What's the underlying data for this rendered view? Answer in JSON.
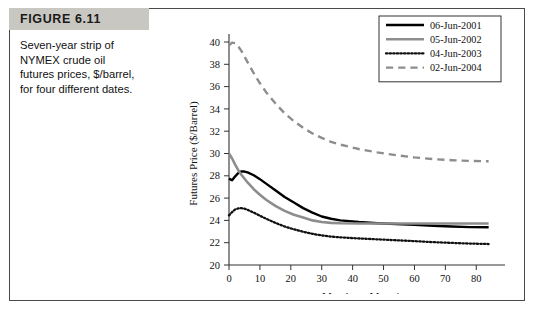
{
  "figure": {
    "number_label": "FIGURE 6.11",
    "caption_lines": [
      "Seven-year strip of",
      "NYMEX crude oil",
      "futures prices, $/barrel,",
      "for four different dates."
    ]
  },
  "chart_data": {
    "type": "line",
    "title": "",
    "xlabel": "Months to Maturity",
    "ylabel": "Futures Price ($/Barrel)",
    "xlim": [
      0,
      88
    ],
    "ylim": [
      20,
      40
    ],
    "xticks": [
      0,
      10,
      20,
      30,
      40,
      50,
      60,
      70,
      80
    ],
    "yticks": [
      20,
      22,
      24,
      26,
      28,
      30,
      32,
      34,
      36,
      38,
      40
    ],
    "grid": false,
    "legend_position": "top-right",
    "series": [
      {
        "name": "06-Jun-2001",
        "style": "solid",
        "color": "#000000",
        "width": 2.4,
        "x": [
          0,
          1,
          2,
          3,
          4,
          5,
          6,
          8,
          10,
          12,
          15,
          18,
          21,
          24,
          27,
          30,
          33,
          36,
          42,
          48,
          54,
          60,
          66,
          72,
          78,
          84
        ],
        "y": [
          27.75,
          27.6,
          27.95,
          28.25,
          28.4,
          28.38,
          28.3,
          28.05,
          27.7,
          27.3,
          26.7,
          26.1,
          25.6,
          25.1,
          24.7,
          24.35,
          24.15,
          24.0,
          23.85,
          23.75,
          23.68,
          23.6,
          23.52,
          23.45,
          23.4,
          23.38
        ]
      },
      {
        "name": "05-Jun-2002",
        "style": "solid",
        "color": "#8d8d8d",
        "width": 2.6,
        "x": [
          0,
          1,
          2,
          3,
          4,
          6,
          8,
          10,
          12,
          15,
          18,
          21,
          24,
          27,
          30,
          33,
          36,
          42,
          48,
          54,
          60,
          66,
          72,
          78,
          84
        ],
        "y": [
          30.0,
          29.55,
          29.0,
          28.5,
          28.1,
          27.4,
          26.8,
          26.3,
          25.85,
          25.3,
          24.85,
          24.5,
          24.25,
          24.0,
          23.85,
          23.78,
          23.74,
          23.72,
          23.72,
          23.72,
          23.72,
          23.72,
          23.72,
          23.72,
          23.72
        ]
      },
      {
        "name": "04-Jun-2003",
        "style": "dotted",
        "color": "#111111",
        "width": 2.3,
        "x": [
          0,
          1,
          2,
          3,
          4,
          5,
          6,
          8,
          10,
          12,
          15,
          18,
          21,
          24,
          27,
          30,
          33,
          36,
          42,
          48,
          54,
          60,
          66,
          72,
          78,
          84
        ],
        "y": [
          24.45,
          24.75,
          24.98,
          25.08,
          25.1,
          25.05,
          24.95,
          24.7,
          24.42,
          24.15,
          23.78,
          23.45,
          23.2,
          22.98,
          22.8,
          22.65,
          22.55,
          22.48,
          22.38,
          22.3,
          22.22,
          22.14,
          22.05,
          21.98,
          21.92,
          21.88
        ]
      },
      {
        "name": "02-Jun-2004",
        "style": "dashed",
        "color": "#8d8d8d",
        "width": 2.4,
        "x": [
          0,
          1,
          2,
          3,
          4,
          6,
          8,
          10,
          12,
          15,
          18,
          21,
          24,
          27,
          30,
          33,
          36,
          42,
          48,
          54,
          60,
          66,
          72,
          78,
          84
        ],
        "y": [
          39.7,
          39.95,
          39.9,
          39.6,
          39.2,
          38.2,
          37.2,
          36.3,
          35.5,
          34.5,
          33.6,
          32.9,
          32.3,
          31.8,
          31.4,
          31.05,
          30.8,
          30.4,
          30.1,
          29.85,
          29.65,
          29.5,
          29.4,
          29.33,
          29.3
        ]
      }
    ]
  }
}
